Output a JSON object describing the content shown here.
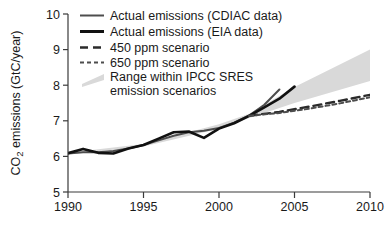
{
  "chart_data": {
    "type": "line",
    "title": "",
    "xlabel": "",
    "ylabel": "CO2 emissions (GtC/year)",
    "ylabel_parts": {
      "pre": "CO",
      "sub": "2",
      "post": " emissions (GtC/year)"
    },
    "xlim": [
      1990,
      2010
    ],
    "ylim": [
      5,
      10
    ],
    "xticks": [
      1990,
      1995,
      2000,
      2005,
      2010
    ],
    "xtick_labels": [
      "1990",
      "1995",
      "2000",
      "2005",
      "2010"
    ],
    "yticks": [
      5,
      6,
      7,
      8,
      9,
      10
    ],
    "ytick_labels": [
      "5",
      "6",
      "7",
      "8",
      "9",
      "10"
    ],
    "grid": false,
    "legend_position": "top-left",
    "series": [
      {
        "name": "Actual emissions (CDIAC data)",
        "style": "solid",
        "color": "#4d4d4d",
        "width": 2.0,
        "x": [
          1990,
          1991,
          1992,
          1993,
          1994,
          1995,
          1996,
          1997,
          1998,
          1999,
          2000,
          2001,
          2002,
          2003,
          2004
        ],
        "y": [
          6.08,
          6.12,
          6.12,
          6.15,
          6.22,
          6.32,
          6.45,
          6.58,
          6.68,
          6.72,
          6.8,
          6.95,
          7.15,
          7.45,
          7.88
        ]
      },
      {
        "name": "Actual emissions (EIA data)",
        "style": "solid",
        "color": "#111111",
        "width": 2.6,
        "x": [
          1990,
          1991,
          1992,
          1993,
          1994,
          1995,
          1996,
          1997,
          1998,
          1999,
          2000,
          2001,
          2002,
          2003,
          2004,
          2005
        ],
        "y": [
          6.09,
          6.21,
          6.1,
          6.08,
          6.22,
          6.32,
          6.5,
          6.68,
          6.7,
          6.52,
          6.78,
          6.93,
          7.14,
          7.38,
          7.62,
          7.96
        ]
      },
      {
        "name": "450 ppm scenario",
        "style": "long-dash",
        "color": "#2b2b2b",
        "width": 2.4,
        "x": [
          2002,
          2004,
          2006,
          2008,
          2010
        ],
        "y": [
          7.14,
          7.25,
          7.4,
          7.56,
          7.73
        ]
      },
      {
        "name": "650 ppm scenario",
        "style": "short-dash",
        "color": "#4d4d4d",
        "width": 2.0,
        "x": [
          2002,
          2004,
          2006,
          2008,
          2010
        ],
        "y": [
          7.14,
          7.22,
          7.34,
          7.49,
          7.66
        ]
      }
    ],
    "band": {
      "name": "Range within IPCC SRES emission scenarios",
      "color": "#d9d9d9",
      "x": [
        1990,
        1995,
        2000,
        2002,
        2005,
        2010
      ],
      "upper": [
        6.1,
        6.35,
        6.9,
        7.2,
        7.95,
        9.0
      ],
      "lower": [
        6.05,
        6.28,
        6.78,
        7.08,
        7.5,
        8.12
      ]
    }
  },
  "legend": {
    "items": [
      {
        "label": "Actual emissions (CDIAC data)",
        "marker": "solid-thin-gray"
      },
      {
        "label": "Actual emissions (EIA data)",
        "marker": "solid-thick-black"
      },
      {
        "label": "450 ppm scenario",
        "marker": "long-dash"
      },
      {
        "label": "650 ppm scenario",
        "marker": "short-dash"
      },
      {
        "label": "Range within IPCC SRES",
        "label2": "emission scenarios",
        "marker": "gray-wedge"
      }
    ]
  },
  "colors": {
    "band": "#d9d9d9",
    "cdiac": "#4d4d4d",
    "eia": "#111111",
    "axis": "#3a3a3a",
    "text": "#1a1a1a"
  }
}
